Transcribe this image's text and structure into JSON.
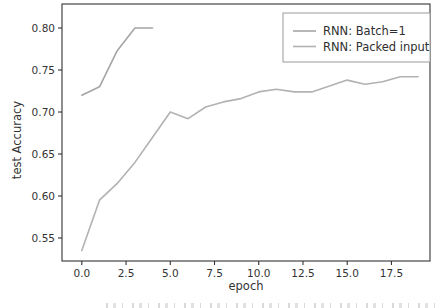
{
  "window": {
    "width": 440,
    "height": 308,
    "background": "#ffffff"
  },
  "chart_data": {
    "type": "line",
    "title": "",
    "xlabel": "epoch",
    "ylabel": "test Accuracy",
    "xlim": [
      -1.12,
      19.68
    ],
    "ylim": [
      0.5226,
      0.8286
    ],
    "xticks": [
      0,
      2.5,
      5,
      7.5,
      10,
      12.5,
      15,
      17.5
    ],
    "xtick_labels": [
      "0.0",
      "2.5",
      "5.0",
      "7.5",
      "10.0",
      "12.5",
      "15.0",
      "17.5"
    ],
    "yticks": [
      0.55,
      0.6,
      0.65,
      0.7,
      0.75,
      0.8
    ],
    "ytick_labels": [
      "0.55",
      "0.60",
      "0.65",
      "0.70",
      "0.75",
      "0.80"
    ],
    "grid": false,
    "legend": {
      "position": "upper right",
      "border_color": "#9a9a9a",
      "background": "#ffffff"
    },
    "axis_color": "#333333",
    "text_color": "#333333",
    "series": [
      {
        "name": "RNN: Batch=1",
        "color": "#a5a5a5",
        "x": [
          0,
          1,
          2,
          3,
          4
        ],
        "y": [
          0.72,
          0.73,
          0.773,
          0.8,
          0.8
        ]
      },
      {
        "name": "RNN: Packed input",
        "color": "#b2b2b2",
        "x": [
          0,
          1,
          2,
          3,
          4,
          5,
          6,
          7,
          8,
          9,
          10,
          11,
          12,
          13,
          14,
          15,
          16,
          17,
          18,
          19
        ],
        "y": [
          0.535,
          0.595,
          0.615,
          0.64,
          0.67,
          0.7,
          0.692,
          0.706,
          0.712,
          0.716,
          0.724,
          0.727,
          0.724,
          0.724,
          0.731,
          0.738,
          0.733,
          0.736,
          0.742,
          0.742
        ]
      }
    ]
  }
}
